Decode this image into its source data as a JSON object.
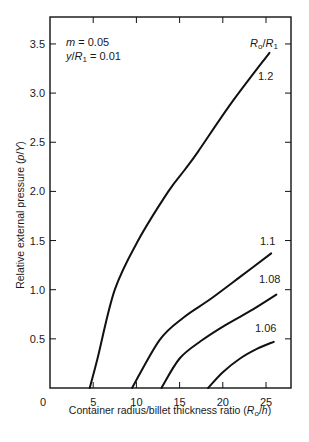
{
  "chart_data": {
    "type": "line",
    "title": "",
    "xlabel": "Container radius/billet thickness ratio (R₀/h)",
    "ylabel": "Relative external pressure (p/Y)",
    "xlim": [
      0,
      27.5
    ],
    "ylim": [
      0,
      3.75
    ],
    "x_ticks": [
      0,
      5,
      10,
      15,
      20,
      25
    ],
    "x_tick_labels": [
      "0",
      "5",
      "10",
      "15",
      "20",
      "25"
    ],
    "y_ticks": [
      0.5,
      1.0,
      1.5,
      2.0,
      2.5,
      3.0,
      3.5
    ],
    "y_tick_labels": [
      "0.5",
      "1.0",
      "1.5",
      "2.0",
      "2.5",
      "3.0",
      "3.5"
    ],
    "grid": false,
    "legend": null,
    "annotations": {
      "params_line1": "m = 0.05",
      "params_line2": "y/R₁ = 0.01",
      "curve_family_label": "R₀/R₁"
    },
    "series": [
      {
        "name": "1.2",
        "x": [
          4.6,
          5.5,
          7.5,
          10.2,
          13.7,
          15.6,
          17.1,
          21.0,
          25.4
        ],
        "y": [
          0.0,
          0.3,
          1.0,
          1.5,
          2.0,
          2.22,
          2.4,
          2.9,
          3.41
        ]
      },
      {
        "name": "1.1",
        "x": [
          9.5,
          12.7,
          15.5,
          18.5,
          22.0,
          25.6
        ],
        "y": [
          0.0,
          0.49,
          0.72,
          0.9,
          1.13,
          1.37
        ]
      },
      {
        "name": "1.08",
        "x": [
          12.9,
          15.0,
          17.5,
          20.3,
          23.5,
          26.2
        ],
        "y": [
          0.0,
          0.3,
          0.48,
          0.64,
          0.8,
          0.95
        ]
      },
      {
        "name": "1.06",
        "x": [
          18.3,
          20.0,
          22.0,
          24.0,
          25.9
        ],
        "y": [
          0.0,
          0.16,
          0.3,
          0.4,
          0.47
        ]
      }
    ]
  }
}
